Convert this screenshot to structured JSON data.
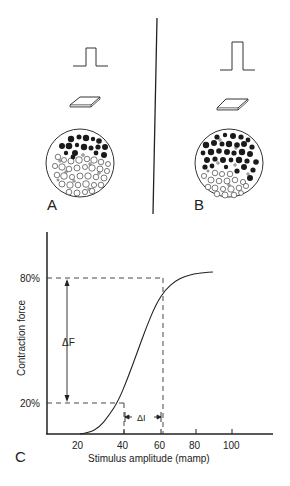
{
  "figure": {
    "panels": {
      "A": {
        "label": "A",
        "stimulus": "small-pulse",
        "description": "Weak stimulus recruits few motor units (filled fibers)"
      },
      "B": {
        "label": "B",
        "stimulus": "large-pulse",
        "description": "Stronger stimulus recruits more motor units (filled fibers)"
      },
      "C": {
        "label": "C"
      }
    },
    "legend_glyphs": {
      "filled_circle": "active-muscle-fiber",
      "open_circle": "inactive-muscle-fiber",
      "square_pulse": "stimulus-pulse-icon",
      "flat_plate": "electrode-icon"
    }
  },
  "chart_data": {
    "type": "line",
    "title": "",
    "xlabel": "Stimulus amplitude  (mamp)",
    "ylabel": "Contraction force",
    "x_ticks": [
      "20",
      "40",
      "60",
      "80",
      "100"
    ],
    "y_ticks": [
      "20%",
      "80%"
    ],
    "xlim": [
      10,
      120
    ],
    "ylim": [
      0,
      100
    ],
    "grid": false,
    "series": [
      {
        "name": "Force vs stimulus (sigmoid)",
        "x": [
          20,
          25,
          30,
          35,
          40,
          45,
          50,
          55,
          60,
          65,
          70,
          75,
          80,
          85,
          90
        ],
        "y": [
          0,
          1,
          4,
          11,
          20,
          34,
          50,
          66,
          80,
          89,
          94,
          97,
          98.5,
          99.3,
          99.7
        ]
      }
    ],
    "annotations": [
      {
        "type": "dashed-reference",
        "label": "20%",
        "x": 40,
        "y": 20
      },
      {
        "type": "dashed-reference",
        "label": "80%",
        "x": 60,
        "y": 80
      },
      {
        "type": "double-arrow-vertical",
        "label": "ΔF",
        "from": "20%",
        "to": "80%"
      },
      {
        "type": "arrow-bracket-horizontal",
        "label": "ΔI",
        "from": 40,
        "to": 60
      }
    ]
  },
  "labels": {
    "panel_a": "A",
    "panel_b": "B",
    "panel_c": "C",
    "y_tick_80": "80%",
    "y_tick_20": "20%",
    "x_tick_20": "20",
    "x_tick_40": "40",
    "x_tick_60": "60",
    "x_tick_80": "80",
    "x_tick_100": "100",
    "x_axis_title": "Stimulus amplitude  (mamp)",
    "y_axis_title": "Contraction force",
    "delta_f": "ΔF",
    "delta_i": "ΔI"
  },
  "muscle_a": {
    "cx": 80,
    "cy": 163,
    "r": 34,
    "filled": [
      [
        71,
        139,
        3.2
      ],
      [
        79,
        137,
        2.5
      ],
      [
        86,
        138,
        3.2
      ],
      [
        93,
        139,
        2.2
      ],
      [
        99,
        141,
        2.8
      ],
      [
        62,
        146,
        3.0
      ],
      [
        69,
        146,
        3.3
      ],
      [
        77,
        145,
        2.2
      ],
      [
        84,
        147,
        3.2
      ],
      [
        91,
        148,
        2.5
      ],
      [
        98,
        147,
        2.6
      ],
      [
        105,
        147,
        3.0
      ],
      [
        66,
        153,
        2.2
      ],
      [
        75,
        153,
        3.0
      ],
      [
        96,
        153,
        2.4
      ],
      [
        104,
        155,
        3.0
      ],
      [
        73,
        157,
        2.4
      ]
    ],
    "open": [
      [
        58,
        157,
        2.8
      ],
      [
        64,
        160,
        2.5
      ],
      [
        71,
        161,
        3.0
      ],
      [
        79,
        160,
        3.3
      ],
      [
        87,
        159,
        2.8
      ],
      [
        94,
        160,
        3.2
      ],
      [
        101,
        162,
        2.8
      ],
      [
        108,
        164,
        2.5
      ],
      [
        55,
        166,
        2.6
      ],
      [
        62,
        167,
        3.2
      ],
      [
        69,
        169,
        2.8
      ],
      [
        77,
        168,
        3.0
      ],
      [
        85,
        167,
        2.5
      ],
      [
        92,
        168,
        3.2
      ],
      [
        100,
        169,
        3.0
      ],
      [
        107,
        171,
        2.6
      ],
      [
        57,
        175,
        2.8
      ],
      [
        64,
        176,
        3.3
      ],
      [
        72,
        177,
        2.6
      ],
      [
        80,
        176,
        3.0
      ],
      [
        88,
        176,
        3.2
      ],
      [
        96,
        177,
        2.8
      ],
      [
        104,
        178,
        3.0
      ],
      [
        62,
        184,
        3.0
      ],
      [
        70,
        185,
        3.2
      ],
      [
        78,
        185,
        2.8
      ],
      [
        86,
        184,
        3.3
      ],
      [
        94,
        185,
        2.6
      ],
      [
        101,
        185,
        2.8
      ],
      [
        69,
        192,
        2.8
      ],
      [
        77,
        193,
        3.0
      ],
      [
        85,
        192,
        2.6
      ],
      [
        92,
        191,
        2.8
      ],
      [
        60,
        161,
        1.2
      ],
      [
        83,
        155,
        1.3
      ],
      [
        90,
        164,
        1.2
      ],
      [
        66,
        172,
        1.2
      ],
      [
        99,
        173,
        1.2
      ],
      [
        74,
        181,
        1.2
      ],
      [
        89,
        189,
        1.2
      ],
      [
        58,
        180,
        1.0
      ]
    ]
  },
  "muscle_b": {
    "cx": 229,
    "cy": 163,
    "r": 34,
    "filled": [
      [
        217,
        137,
        2.6
      ],
      [
        225,
        135,
        2.2
      ],
      [
        233,
        136,
        3.0
      ],
      [
        241,
        137,
        2.6
      ],
      [
        248,
        140,
        2.4
      ],
      [
        206,
        145,
        3.2
      ],
      [
        214,
        143,
        3.0
      ],
      [
        222,
        144,
        2.5
      ],
      [
        229,
        144,
        3.2
      ],
      [
        237,
        145,
        2.8
      ],
      [
        244,
        144,
        3.0
      ],
      [
        252,
        147,
        2.6
      ],
      [
        203,
        153,
        2.4
      ],
      [
        211,
        152,
        3.2
      ],
      [
        219,
        151,
        2.8
      ],
      [
        227,
        152,
        3.0
      ],
      [
        234,
        153,
        2.6
      ],
      [
        242,
        152,
        3.2
      ],
      [
        250,
        154,
        3.0
      ],
      [
        207,
        160,
        3.0
      ],
      [
        215,
        159,
        2.6
      ],
      [
        223,
        160,
        3.0
      ],
      [
        231,
        160,
        2.4
      ],
      [
        239,
        160,
        3.2
      ],
      [
        247,
        161,
        2.6
      ],
      [
        256,
        162,
        2.8
      ],
      [
        205,
        167,
        2.6
      ],
      [
        212,
        166,
        2.4
      ],
      [
        226,
        167,
        2.2
      ],
      [
        244,
        167,
        3.0
      ],
      [
        253,
        170,
        2.6
      ],
      [
        250,
        178,
        3.0
      ],
      [
        237,
        171,
        2.6
      ]
    ],
    "open": [
      [
        215,
        173,
        2.8
      ],
      [
        222,
        174,
        2.6
      ],
      [
        230,
        174,
        2.8
      ],
      [
        204,
        176,
        2.6
      ],
      [
        211,
        180,
        3.0
      ],
      [
        219,
        181,
        2.8
      ],
      [
        227,
        181,
        3.0
      ],
      [
        235,
        180,
        2.8
      ],
      [
        243,
        182,
        2.6
      ],
      [
        208,
        187,
        2.8
      ],
      [
        215,
        188,
        3.0
      ],
      [
        223,
        189,
        2.6
      ],
      [
        231,
        189,
        3.2
      ],
      [
        239,
        188,
        2.8
      ],
      [
        246,
        186,
        2.6
      ],
      [
        217,
        194,
        2.8
      ],
      [
        225,
        195,
        3.0
      ],
      [
        234,
        195,
        2.8
      ],
      [
        241,
        193,
        2.4
      ],
      [
        218,
        163,
        1.2
      ],
      [
        235,
        165,
        1.2
      ],
      [
        248,
        174,
        1.2
      ],
      [
        208,
        171,
        1.0
      ],
      [
        229,
        185,
        1.2
      ],
      [
        220,
        140,
        1.2
      ],
      [
        236,
        148,
        1.2
      ]
    ]
  }
}
